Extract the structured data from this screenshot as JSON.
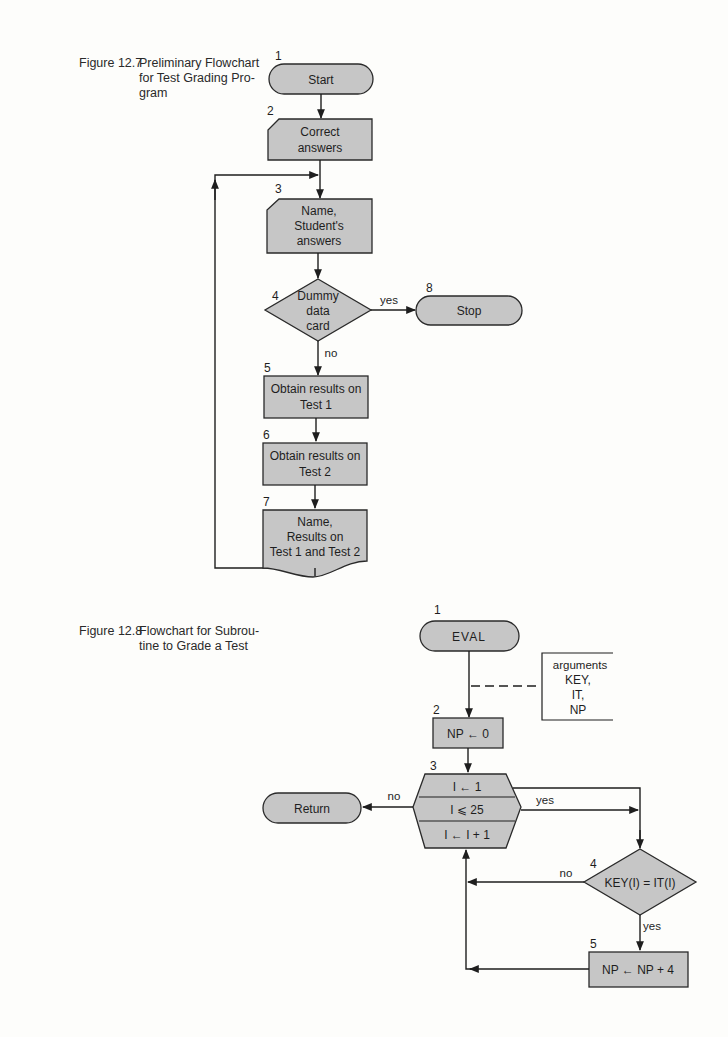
{
  "figure_12_7": {
    "caption_number": "Figure 12.7",
    "caption_lines": [
      "Preliminary Flowchart",
      "for Test Grading Pro-",
      "gram"
    ],
    "nodes": [
      {
        "step": "1",
        "shape": "terminal",
        "lines": [
          "Start"
        ]
      },
      {
        "step": "2",
        "shape": "card-input",
        "lines": [
          "Correct",
          "answers"
        ]
      },
      {
        "step": "3",
        "shape": "card-input",
        "lines": [
          "Name,",
          "Student's",
          "answers"
        ]
      },
      {
        "step": "4",
        "shape": "decision",
        "lines": [
          "Dummy",
          "data",
          "card"
        ]
      },
      {
        "step": "5",
        "shape": "process",
        "lines": [
          "Obtain results on",
          "Test 1"
        ]
      },
      {
        "step": "6",
        "shape": "process",
        "lines": [
          "Obtain results on",
          "Test 2"
        ]
      },
      {
        "step": "7",
        "shape": "document-output",
        "lines": [
          "Name,",
          "Results on",
          "Test 1 and Test 2"
        ]
      },
      {
        "step": "8",
        "shape": "terminal",
        "lines": [
          "Stop"
        ]
      }
    ],
    "edge_labels": {
      "yes": "yes",
      "no": "no"
    }
  },
  "figure_12_8": {
    "caption_number": "Figure 12.8",
    "caption_lines": [
      "Flowchart for Subrou-",
      "tine to Grade a Test"
    ],
    "nodes": [
      {
        "step": "1",
        "shape": "terminal",
        "lines": [
          "EVAL"
        ]
      },
      {
        "step": "2",
        "shape": "process",
        "lines": [
          "NP ← 0"
        ]
      },
      {
        "step": "3",
        "shape": "loop-hexagon",
        "lines": [
          "I ← 1",
          "I ⩽ 25",
          "I ← I + 1"
        ]
      },
      {
        "step": "4",
        "shape": "decision",
        "lines": [
          "KEY(I) = IT(I)"
        ]
      },
      {
        "step": "5",
        "shape": "process",
        "lines": [
          "NP ← NP + 4"
        ]
      },
      {
        "step": "",
        "shape": "terminal",
        "lines": [
          "Return"
        ]
      }
    ],
    "annotation": {
      "lines": [
        "arguments",
        "KEY,",
        "IT,",
        "NP"
      ]
    },
    "edge_labels": {
      "loop_no": "no",
      "loop_yes": "yes",
      "dec_no": "no",
      "dec_yes": "yes"
    }
  }
}
